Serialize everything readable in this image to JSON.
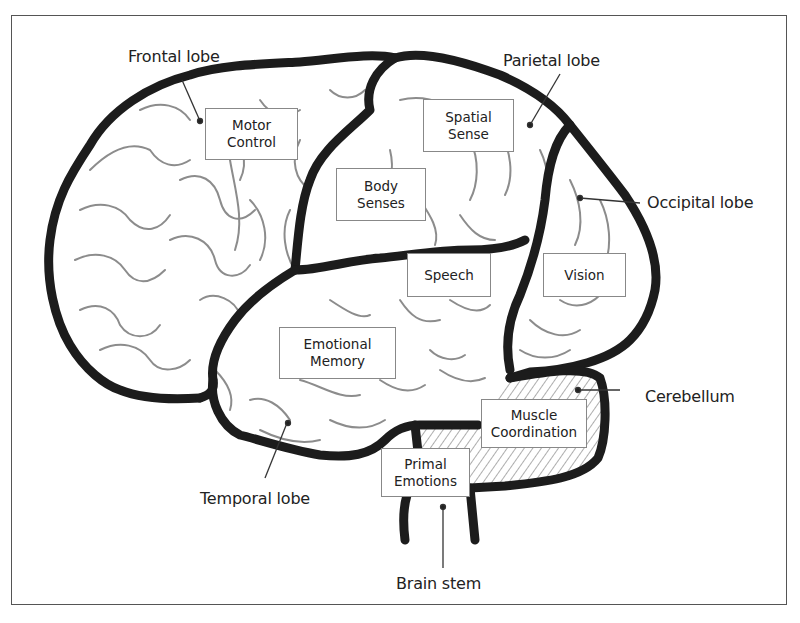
{
  "diagram": {
    "colors": {
      "outline": "#1c1c1c",
      "gyri": "#8c8c8c",
      "frame": "#555555",
      "background": "#ffffff"
    },
    "lobe_labels": {
      "frontal": "Frontal lobe",
      "parietal": "Parietal lobe",
      "occipital": "Occipital lobe",
      "cerebellum": "Cerebellum",
      "temporal": "Temporal lobe",
      "brain_stem": "Brain stem"
    },
    "function_boxes": {
      "motor_control": {
        "line1": "Motor",
        "line2": "Control"
      },
      "spatial_sense": {
        "line1": "Spatial",
        "line2": "Sense"
      },
      "body_senses": {
        "line1": "Body",
        "line2": "Senses"
      },
      "speech": {
        "line1": "Speech"
      },
      "vision": {
        "line1": "Vision"
      },
      "emotional_memory": {
        "line1": "Emotional",
        "line2": "Memory"
      },
      "muscle_coordination": {
        "line1": "Muscle",
        "line2": "Coordination"
      },
      "primal_emotions": {
        "line1": "Primal",
        "line2": "Emotions"
      }
    }
  }
}
